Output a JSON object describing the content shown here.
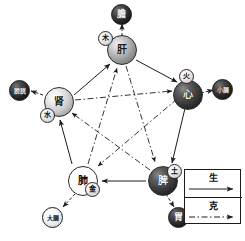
{
  "diagram": {
    "nodes": [
      {
        "id": "liver",
        "organ": "肝",
        "element": "木",
        "bowel": "膽",
        "position": "top",
        "fill": "mid",
        "bowel_fill": "blackfu"
      },
      {
        "id": "heart",
        "organ": "心",
        "element": "火",
        "bowel": "小腸",
        "position": "right",
        "fill": "dark",
        "bowel_fill": "blackfu"
      },
      {
        "id": "spleen",
        "organ": "脾",
        "element": "土",
        "bowel": "胃",
        "position": "bottom-right",
        "fill": "dark",
        "bowel_fill": "blackfu"
      },
      {
        "id": "lung",
        "organ": "肺",
        "element": "金",
        "bowel": "大腸",
        "position": "bottom-left",
        "fill": "white",
        "bowel_fill": "whitefu"
      },
      {
        "id": "kidney",
        "organ": "肾",
        "element": "水",
        "bowel": "膀胱",
        "position": "left",
        "fill": "light",
        "bowel_fill": "blackfu"
      }
    ],
    "legend": {
      "sheng_label": "生",
      "ke_label": "克"
    },
    "edges": {
      "sheng": [
        {
          "from": "liver",
          "to": "heart"
        },
        {
          "from": "heart",
          "to": "spleen"
        },
        {
          "from": "spleen",
          "to": "lung"
        },
        {
          "from": "lung",
          "to": "kidney"
        },
        {
          "from": "kidney",
          "to": "liver"
        }
      ],
      "ke": [
        {
          "from": "liver",
          "to": "spleen"
        },
        {
          "from": "spleen",
          "to": "kidney"
        },
        {
          "from": "kidney",
          "to": "heart"
        },
        {
          "from": "heart",
          "to": "lung"
        },
        {
          "from": "lung",
          "to": "liver"
        }
      ],
      "organ_pairs": [
        {
          "from": "liver",
          "to": "gallbladder"
        },
        {
          "from": "heart",
          "to": "small-intestine"
        },
        {
          "from": "spleen",
          "to": "stomach"
        },
        {
          "from": "lung",
          "to": "large-intestine"
        },
        {
          "from": "kidney",
          "to": "bladder"
        }
      ]
    }
  },
  "colors": {
    "line": "#1c1c1c",
    "background": "#ffffff"
  }
}
